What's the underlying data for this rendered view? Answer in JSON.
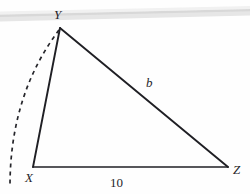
{
  "figure": {
    "background_color": "#fefefe",
    "stroke_color": "#1f1f24",
    "label_color": "#25252a",
    "artifact_color": "#e2e2e2",
    "width": 250,
    "height": 194
  },
  "labels": {
    "vertex_y": "Y",
    "vertex_x": "X",
    "vertex_z": "Z",
    "side_b": "b",
    "base_length": "10"
  },
  "geometry": {
    "vertices": {
      "Y": {
        "x": 60,
        "y": 28
      },
      "X": {
        "x": 33,
        "y": 167
      },
      "Z": {
        "x": 228,
        "y": 167
      }
    },
    "segments": [
      {
        "name": "side-xy",
        "from": "X",
        "to": "Y",
        "style": "solid"
      },
      {
        "name": "side-yz",
        "from": "Y",
        "to": "Z",
        "style": "solid",
        "label": "b"
      },
      {
        "name": "side-xz",
        "from": "X",
        "to": "Z",
        "style": "solid",
        "label": "10"
      }
    ],
    "arc": {
      "name": "swing-arc",
      "style": "dashed",
      "start": {
        "x": 59,
        "y": 30
      },
      "control": {
        "x": 10,
        "y": 95
      },
      "end": {
        "x": 10,
        "y": 186
      }
    },
    "scan_band": {
      "name": "scan-artifact-band",
      "left_y": 16,
      "right_y": 11,
      "thickness": 7
    }
  }
}
